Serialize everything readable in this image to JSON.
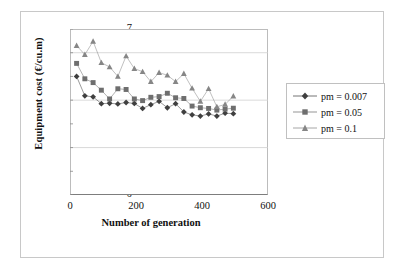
{
  "chart_data": {
    "type": "scatter",
    "title": "",
    "xlabel": "Number of generation",
    "ylabel": "Equipment cost (€/cu.m)",
    "xlim": [
      0,
      600
    ],
    "ylim": [
      0,
      7
    ],
    "xticks": [
      0,
      200,
      400,
      600
    ],
    "yticks": [
      0,
      1,
      2,
      3,
      4,
      5,
      6,
      7
    ],
    "grid": "horizontal-major",
    "legend_position": "right",
    "x": [
      20,
      45,
      70,
      95,
      120,
      145,
      170,
      195,
      220,
      245,
      270,
      295,
      320,
      345,
      370,
      395,
      420,
      445,
      470,
      495
    ],
    "series": [
      {
        "name": "pm = 0.007",
        "marker": "diamond",
        "color": "#3f3f3f",
        "values": [
          5.0,
          4.18,
          4.14,
          3.85,
          3.87,
          3.84,
          3.9,
          3.86,
          3.65,
          3.81,
          3.95,
          3.68,
          3.85,
          3.5,
          3.38,
          3.33,
          3.42,
          3.33,
          3.45,
          3.43
        ]
      },
      {
        "name": "pm = 0.05",
        "marker": "square",
        "color": "#6e6e6e",
        "values": [
          5.55,
          4.9,
          4.74,
          4.42,
          4.05,
          4.48,
          4.45,
          4.05,
          3.98,
          4.12,
          4.15,
          4.29,
          4.1,
          4.07,
          3.75,
          3.68,
          3.65,
          3.58,
          3.62,
          3.66
        ]
      },
      {
        "name": "pm = 0.1",
        "marker": "triangle",
        "color": "#868686",
        "values": [
          6.3,
          5.92,
          6.48,
          5.58,
          5.4,
          5.0,
          5.86,
          5.33,
          5.2,
          4.78,
          5.16,
          5.05,
          4.78,
          5.12,
          4.5,
          3.95,
          4.48,
          3.72,
          3.82,
          4.17
        ]
      }
    ]
  },
  "legend": {
    "items": [
      {
        "label": "pm = 0.007"
      },
      {
        "label": "pm = 0.05"
      },
      {
        "label": "pm = 0.1"
      }
    ]
  }
}
